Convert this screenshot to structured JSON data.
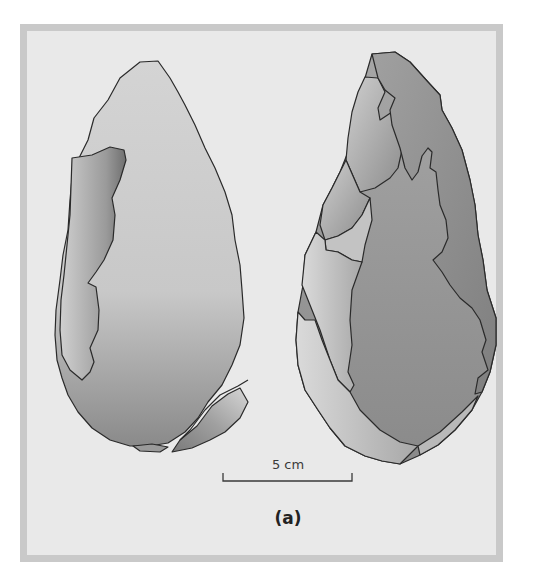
{
  "figure": {
    "panel_label": "(a)",
    "scale_bar": {
      "label": "5 cm",
      "length_cm": 5
    },
    "objects": [
      {
        "name": "handaxe-face-left",
        "description": "Stone handaxe, flat face view with flake scars along left edge and lower right"
      },
      {
        "name": "handaxe-face-right",
        "description": "Stone handaxe, opposite face with multiple large flake scars"
      }
    ],
    "colors": {
      "background": "#e9e9e9",
      "frame_border": "#c9c9c9",
      "outline": "#2a2a2a",
      "stone_light": "#d2d2d2",
      "stone_mid": "#a8a8a8",
      "stone_dark": "#7e7e7e"
    }
  }
}
